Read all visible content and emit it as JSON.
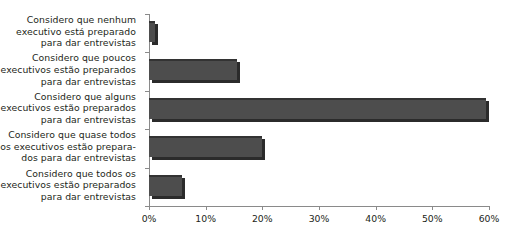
{
  "chart_data": {
    "type": "bar",
    "orientation": "horizontal",
    "title": "",
    "subtitle": "",
    "xlabel": "",
    "ylabel": "",
    "categories": [
      "Considero que nenhum executivo está preparado para dar entrevistas",
      "Considero que poucos executivos estão preparados para dar entrevistas",
      "Considero que alguns executivos estão preparados para dar entrevistas",
      "Considero que quase todos os executivos estão prepara-dos para dar entrevistas",
      "Considero que todos os executivos estão preparados para dar entrevistas"
    ],
    "category_lines": [
      [
        "Considero que nenhum",
        "executivo está preparado",
        "para dar entrevistas"
      ],
      [
        "Considero que poucos",
        "executivos estão preparados",
        "para dar entrevistas"
      ],
      [
        "Considero que alguns",
        "executivos estão preparados",
        "para dar entrevistas"
      ],
      [
        "Considero que quase todos",
        "os executivos estão prepara-",
        "dos para dar entrevistas"
      ],
      [
        "Considero que todos os",
        "executivos estão preparados",
        "para dar entrevistas"
      ]
    ],
    "values": [
      1,
      16,
      61,
      20.5,
      6
    ],
    "value_unit": "%",
    "xlim": [
      0,
      61.5
    ],
    "xticks": [
      0,
      10,
      20,
      30,
      40,
      50,
      60
    ],
    "xtick_labels": [
      "0%",
      "10%",
      "20%",
      "30%",
      "40%",
      "50%",
      "60%"
    ],
    "grid": false,
    "legend": "none",
    "bar_color": "#4d4d4d",
    "bar_shadow_color": "#2b2b2b",
    "bar_edge_color": "#333333",
    "axis_color": "#8a8a8a",
    "background": "#ffffff"
  }
}
